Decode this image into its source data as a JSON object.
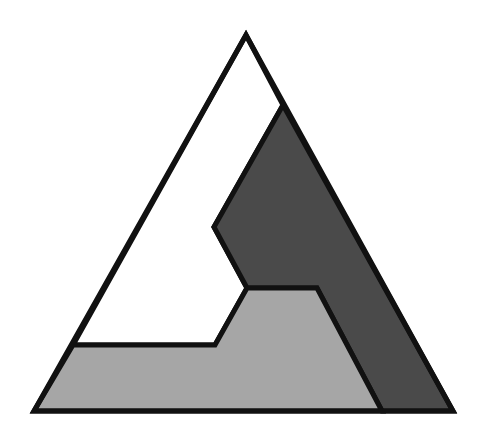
{
  "diagram": {
    "type": "triangle-partition",
    "canvas": {
      "width": 477,
      "height": 436,
      "background": "#ffffff"
    },
    "outline_color": "#111111",
    "outline_width": 5,
    "outer_triangle": {
      "apex": [
        246,
        35
      ],
      "bottom_left": [
        34,
        411
      ],
      "bottom_right": [
        453,
        411
      ]
    },
    "regions": [
      {
        "name": "white-region",
        "fill": "#ffffff",
        "points": [
          [
            246,
            35
          ],
          [
            283,
            105
          ],
          [
            214,
            227
          ],
          [
            247,
            288
          ],
          [
            215,
            345
          ],
          [
            73,
            345
          ]
        ]
      },
      {
        "name": "dark-region",
        "fill": "#4a4a4a",
        "points": [
          [
            283,
            105
          ],
          [
            453,
            411
          ],
          [
            382,
            411
          ],
          [
            317,
            288
          ],
          [
            247,
            288
          ],
          [
            214,
            227
          ]
        ]
      },
      {
        "name": "light-region",
        "fill": "#a6a6a6",
        "points": [
          [
            73,
            345
          ],
          [
            215,
            345
          ],
          [
            247,
            288
          ],
          [
            317,
            288
          ],
          [
            382,
            411
          ],
          [
            34,
            411
          ]
        ]
      }
    ]
  }
}
